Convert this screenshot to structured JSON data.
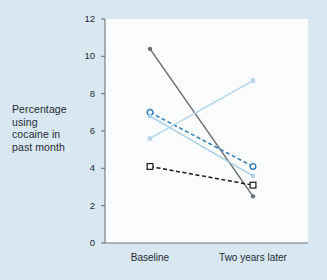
{
  "chart_data": {
    "type": "line",
    "title": "",
    "subtitle": "",
    "xlabel": "",
    "ylabel": "Percentage using cocaine in past month",
    "ylabel_lines": [
      "Percentage",
      "using",
      "cocaine in",
      "past month"
    ],
    "categories": [
      "Baseline",
      "Two years later"
    ],
    "x": [
      0,
      1
    ],
    "ylim": [
      0,
      12
    ],
    "yticks": [
      0,
      2,
      4,
      6,
      8,
      10,
      12
    ],
    "ytick_labels": [
      "0",
      "2",
      "4",
      "6",
      "8",
      "10",
      "12"
    ],
    "grid": false,
    "legend": "none",
    "series": [
      {
        "name": "series-dark-solid",
        "values": [
          10.4,
          2.5
        ],
        "color": "#6b6f72",
        "dash": "solid",
        "marker": "filled-circle"
      },
      {
        "name": "series-blue-dashed",
        "values": [
          7.0,
          4.1
        ],
        "color": "#2e7ebb",
        "dash": "dashed",
        "marker": "open-circle"
      },
      {
        "name": "series-lightblue-falling",
        "values": [
          6.8,
          3.6
        ],
        "color": "#a8cfe8",
        "dash": "solid",
        "marker": "filled-circle"
      },
      {
        "name": "series-lightblue-rising",
        "values": [
          5.6,
          8.7
        ],
        "color": "#b5d5ea",
        "dash": "solid",
        "marker": "filled-square"
      },
      {
        "name": "series-black-dashed",
        "values": [
          4.1,
          3.1
        ],
        "color": "#1a1a1a",
        "dash": "dashed",
        "marker": "open-square"
      }
    ],
    "colors": {
      "page_background": "#d9e7f3",
      "plot_background": "#fbfcfd",
      "axis": "#6f7579",
      "text": "#1d2a33"
    }
  }
}
